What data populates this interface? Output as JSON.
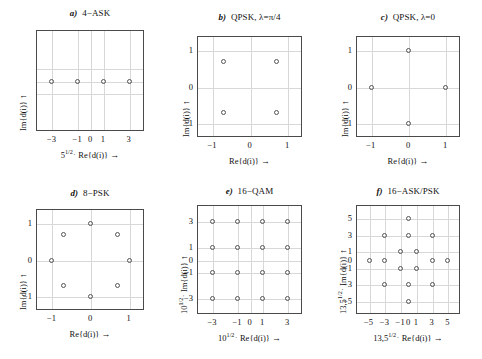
{
  "figure": {
    "background": "#ffffff",
    "point_color": "#555555",
    "grid_color": "#d8d8d8",
    "frame_color": "#4a4a4a",
    "arrow_glyph": "→",
    "arrow_up_glyph": "↑",
    "middot": "·"
  },
  "chart_data": [
    {
      "id": "a",
      "type": "scatter",
      "title": "4−ASK",
      "panel_letter": "a)",
      "xlabel_prefix": "5",
      "xlabel_sup": "1/2",
      "xlabel_main": "Re{d(i)}",
      "xlabel_full": "5^1/2 · Re{d(i)} →",
      "ylabel_full": "Im{d(i)} ↑",
      "ylabel_main": "Im{d(i)}",
      "xlim": [
        -4.2,
        4.2
      ],
      "ylim": [
        -4.2,
        4.2
      ],
      "xticks": [
        -3,
        -1,
        0,
        1,
        3
      ],
      "xticklabels": [
        "−3",
        "−1",
        "0",
        "1",
        "3"
      ],
      "yticks": [],
      "yticklabels": [],
      "gridlines_x": [
        -3,
        -1,
        0,
        1,
        3
      ],
      "gridlines_y": [
        -1,
        0,
        1
      ],
      "grid": true,
      "points": [
        {
          "x": -3,
          "y": 0
        },
        {
          "x": -1,
          "y": 0
        },
        {
          "x": 1,
          "y": 0
        },
        {
          "x": 3,
          "y": 0
        }
      ]
    },
    {
      "id": "b",
      "type": "scatter",
      "title": "QPSK, λ=π/4",
      "panel_letter": "b)",
      "xlabel_full": "Re{d(i)} →",
      "xlabel_main": "Re{d(i)}",
      "ylabel_full": "Im{d(i)} ↑",
      "ylabel_main": "Im{d(i)}",
      "xlim": [
        -1.4,
        1.4
      ],
      "ylim": [
        -1.4,
        1.4
      ],
      "xticks": [
        -1,
        0,
        1
      ],
      "xticklabels": [
        "−1",
        "0",
        "1"
      ],
      "yticks": [
        -1,
        0,
        1
      ],
      "yticklabels": [
        "−1",
        "0",
        "1"
      ],
      "gridlines_x": [
        -1,
        0,
        1
      ],
      "gridlines_y": [
        -1,
        0,
        1
      ],
      "grid": true,
      "points": [
        {
          "x": -0.707,
          "y": 0.707
        },
        {
          "x": 0.707,
          "y": 0.707
        },
        {
          "x": -0.707,
          "y": -0.707
        },
        {
          "x": 0.707,
          "y": -0.707
        }
      ]
    },
    {
      "id": "c",
      "type": "scatter",
      "title": "QPSK, λ=0",
      "panel_letter": "c)",
      "xlabel_full": "Re{d(i)} →",
      "xlabel_main": "Re{d(i)}",
      "ylabel_full": "Im{d(i)} ↑",
      "ylabel_main": "Im{d(i)}",
      "xlim": [
        -1.4,
        1.4
      ],
      "ylim": [
        -1.4,
        1.4
      ],
      "xticks": [
        -1,
        0,
        1
      ],
      "xticklabels": [
        "−1",
        "0",
        "1"
      ],
      "yticks": [
        -1,
        0,
        1
      ],
      "yticklabels": [
        "−1",
        "0",
        "1"
      ],
      "gridlines_x": [
        -1,
        0,
        1
      ],
      "gridlines_y": [
        -1,
        0,
        1
      ],
      "grid": true,
      "points": [
        {
          "x": 0,
          "y": 1
        },
        {
          "x": -1,
          "y": 0
        },
        {
          "x": 1,
          "y": 0
        },
        {
          "x": 0,
          "y": -1
        }
      ]
    },
    {
      "id": "d",
      "type": "scatter",
      "title": "8−PSK",
      "panel_letter": "d)",
      "xlabel_full": "Re{d(i)} →",
      "xlabel_main": "Re{d(i)}",
      "ylabel_full": "Im{d(i)} ↑",
      "ylabel_main": "Im{d(i)}",
      "xlim": [
        -1.4,
        1.4
      ],
      "ylim": [
        -1.4,
        1.4
      ],
      "xticks": [
        -1,
        0,
        1
      ],
      "xticklabels": [
        "−1",
        "0",
        "1"
      ],
      "yticks": [
        -1,
        0,
        1
      ],
      "yticklabels": [
        "−1",
        "0",
        "1"
      ],
      "gridlines_x": [
        -1,
        0,
        1
      ],
      "gridlines_y": [
        -1,
        0,
        1
      ],
      "grid": true,
      "points": [
        {
          "x": 1,
          "y": 0
        },
        {
          "x": 0.707,
          "y": 0.707
        },
        {
          "x": 0,
          "y": 1
        },
        {
          "x": -0.707,
          "y": 0.707
        },
        {
          "x": -1,
          "y": 0
        },
        {
          "x": -0.707,
          "y": -0.707
        },
        {
          "x": 0,
          "y": -1
        },
        {
          "x": 0.707,
          "y": -0.707
        }
      ]
    },
    {
      "id": "e",
      "type": "scatter",
      "title": "16−QAM",
      "panel_letter": "e)",
      "xlabel_prefix": "10",
      "xlabel_sup": "1/2",
      "xlabel_main": "Re{d(i)}",
      "xlabel_full": "10^1/2 · Re{d(i)} →",
      "ylabel_prefix": "10",
      "ylabel_sup": "1/2",
      "ylabel_main": "Im{d(i)}",
      "ylabel_full": "10^1/2 · Im{d(i)} ↑",
      "xlim": [
        -4.2,
        4.2
      ],
      "ylim": [
        -4.2,
        4.2
      ],
      "xticks": [
        -3,
        -1,
        0,
        1,
        3
      ],
      "xticklabels": [
        "−3",
        "−1",
        "0",
        "1",
        "3"
      ],
      "yticks": [
        -3,
        -1,
        0,
        1,
        3
      ],
      "yticklabels": [
        "−3",
        "−1",
        "0",
        "1",
        "3"
      ],
      "gridlines_x": [
        -3,
        -1,
        0,
        1,
        3
      ],
      "gridlines_y": [
        -3,
        -1,
        0,
        1,
        3
      ],
      "grid": true,
      "points": [
        {
          "x": -3,
          "y": 3
        },
        {
          "x": -1,
          "y": 3
        },
        {
          "x": 1,
          "y": 3
        },
        {
          "x": 3,
          "y": 3
        },
        {
          "x": -3,
          "y": 1
        },
        {
          "x": -1,
          "y": 1
        },
        {
          "x": 1,
          "y": 1
        },
        {
          "x": 3,
          "y": 1
        },
        {
          "x": -3,
          "y": -1
        },
        {
          "x": -1,
          "y": -1
        },
        {
          "x": 1,
          "y": -1
        },
        {
          "x": 3,
          "y": -1
        },
        {
          "x": -3,
          "y": -3
        },
        {
          "x": -1,
          "y": -3
        },
        {
          "x": 1,
          "y": -3
        },
        {
          "x": 3,
          "y": -3
        }
      ]
    },
    {
      "id": "f",
      "type": "scatter",
      "title": "16−ASK/PSK",
      "panel_letter": "f)",
      "xlabel_prefix": "13,5",
      "xlabel_sup": "1/2",
      "xlabel_main": "Re{d(i)}",
      "xlabel_full": "13,5^1/2 · Re{d(i)} →",
      "ylabel_prefix": "13,5",
      "ylabel_sup": "1/2",
      "ylabel_main": "Im{d(i)}",
      "ylabel_full": "13,5^1/2 · Im{d(i)} ↑",
      "xlim": [
        -6.6,
        6.6
      ],
      "ylim": [
        -6.6,
        6.6
      ],
      "xticks": [
        -5,
        -3,
        -1,
        0,
        1,
        3,
        5
      ],
      "xticklabels": [
        "−5",
        "−3",
        "−1",
        "0",
        "1",
        "3",
        "5"
      ],
      "yticks": [
        -5,
        -3,
        -1,
        0,
        1,
        3,
        5
      ],
      "yticklabels": [
        "−5",
        "−3",
        "−1",
        "0",
        "1",
        "3",
        "5"
      ],
      "gridlines_x": [
        -5,
        -3,
        -1,
        1,
        3,
        5
      ],
      "gridlines_y": [
        -5,
        -3,
        -1,
        1,
        3,
        5
      ],
      "grid": true,
      "points": [
        {
          "x": 0,
          "y": 5
        },
        {
          "x": -3,
          "y": 3
        },
        {
          "x": 0,
          "y": 3
        },
        {
          "x": 3,
          "y": 3
        },
        {
          "x": -1,
          "y": 1
        },
        {
          "x": 1,
          "y": 1
        },
        {
          "x": -5,
          "y": 0
        },
        {
          "x": -3,
          "y": 0
        },
        {
          "x": 3,
          "y": 0
        },
        {
          "x": 5,
          "y": 0
        },
        {
          "x": -1,
          "y": -1
        },
        {
          "x": 1,
          "y": -1
        },
        {
          "x": -3,
          "y": -3
        },
        {
          "x": 0,
          "y": -3
        },
        {
          "x": 3,
          "y": -3
        },
        {
          "x": 0,
          "y": -5
        }
      ]
    }
  ]
}
